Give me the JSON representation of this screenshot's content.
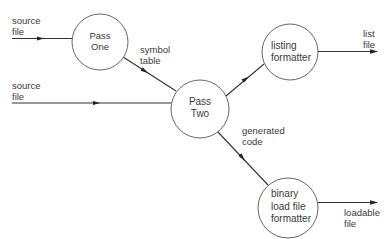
{
  "diagram": {
    "type": "data-flow",
    "nodes": [
      {
        "id": "pass_one",
        "lines": [
          "Pass",
          "One"
        ],
        "cx": 100,
        "cy": 42,
        "r": 28
      },
      {
        "id": "pass_two",
        "lines": [
          "Pass",
          "Two"
        ],
        "cx": 200,
        "cy": 109,
        "r": 29
      },
      {
        "id": "listing_formatter",
        "lines": [
          "listing",
          "formatter"
        ],
        "cx": 290,
        "cy": 52,
        "r": 28
      },
      {
        "id": "binary_load_file_formatter",
        "lines": [
          "binary",
          "load file",
          "formatter"
        ],
        "cx": 288,
        "cy": 208,
        "r": 30
      }
    ],
    "edges": [
      {
        "from": "external",
        "to": "pass_one",
        "label": [
          "source",
          "file"
        ]
      },
      {
        "from": "external",
        "to": "pass_two",
        "label": [
          "source",
          "file"
        ]
      },
      {
        "from": "pass_one",
        "to": "pass_two",
        "label": [
          "symbol",
          "table"
        ]
      },
      {
        "from": "pass_two",
        "to": "listing_formatter",
        "label": []
      },
      {
        "from": "listing_formatter",
        "to": "external",
        "label": [
          "list",
          "file"
        ]
      },
      {
        "from": "pass_two",
        "to": "binary_load_file_formatter",
        "label": [
          "generated",
          "code"
        ]
      },
      {
        "from": "binary_load_file_formatter",
        "to": "external",
        "label": [
          "loadable",
          "file"
        ]
      }
    ]
  },
  "labels": {
    "source_file_1": {
      "line1": "source",
      "line2": "file"
    },
    "source_file_2": {
      "line1": "source",
      "line2": "file"
    },
    "symbol_table": {
      "line1": "symbol",
      "line2": "table"
    },
    "list_file": {
      "line1": "list",
      "line2": "file"
    },
    "generated_code": {
      "line1": "generated",
      "line2": "code"
    },
    "loadable_file": {
      "line1": "loadable",
      "line2": "file"
    }
  },
  "nodes": {
    "pass_one": {
      "line1": "Pass",
      "line2": "One"
    },
    "pass_two": {
      "line1": "Pass",
      "line2": "Two"
    },
    "listing_formatter": {
      "line1": "listing",
      "line2": "formatter"
    },
    "binary_formatter": {
      "line1": "binary",
      "line2": "load file",
      "line3": "formatter"
    }
  },
  "colors": {
    "line": "#333333",
    "circle_stroke": "#555555",
    "text": "#3a3a3a",
    "background": "#ffffff"
  }
}
